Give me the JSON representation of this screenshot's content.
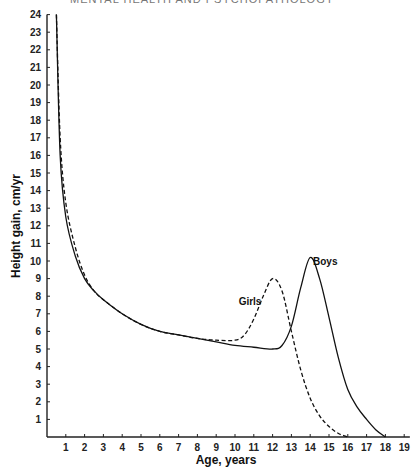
{
  "header": {
    "text": "MENTAL HEALTH AND PSYCHOPATHOLOGY"
  },
  "chart_data": {
    "type": "line",
    "title": "",
    "xlabel": "Age, years",
    "ylabel": "Height gain, cm/yr",
    "xlim": [
      0,
      19
    ],
    "ylim": [
      0,
      24
    ],
    "x_ticks": [
      1,
      2,
      3,
      4,
      5,
      6,
      7,
      8,
      9,
      10,
      11,
      12,
      13,
      14,
      15,
      16,
      17,
      18,
      19
    ],
    "y_ticks": [
      1,
      2,
      3,
      4,
      5,
      6,
      7,
      8,
      9,
      10,
      11,
      12,
      13,
      14,
      15,
      16,
      17,
      18,
      19,
      20,
      21,
      22,
      23,
      24
    ],
    "grid": false,
    "legend": "inline annotations",
    "series": [
      {
        "name": "Boys",
        "style": "solid",
        "x": [
          0.5,
          0.7,
          1.0,
          1.5,
          2.0,
          2.5,
          3.0,
          4.0,
          5.0,
          6.0,
          7.0,
          8.0,
          9.0,
          10.0,
          11.0,
          12.0,
          12.5,
          13.0,
          13.5,
          14.0,
          14.5,
          15.0,
          15.5,
          16.0,
          16.5,
          17.0,
          17.5,
          18.0
        ],
        "values": [
          24,
          16.0,
          12.5,
          10.3,
          9.0,
          8.3,
          7.8,
          7.0,
          6.4,
          6.0,
          5.8,
          5.6,
          5.4,
          5.2,
          5.1,
          5.0,
          5.2,
          6.3,
          8.5,
          10.2,
          9.0,
          6.8,
          4.5,
          2.7,
          1.7,
          1.0,
          0.4,
          0.0
        ]
      },
      {
        "name": "Girls",
        "style": "dashed",
        "x": [
          0.5,
          0.7,
          1.0,
          1.5,
          2.0,
          2.5,
          3.0,
          4.0,
          5.0,
          6.0,
          7.0,
          8.0,
          9.0,
          10.0,
          10.5,
          11.0,
          11.5,
          12.0,
          12.5,
          13.0,
          13.5,
          14.0,
          14.5,
          15.0,
          15.5,
          16.0
        ],
        "values": [
          24,
          17.0,
          13.3,
          10.8,
          9.2,
          8.3,
          7.8,
          7.0,
          6.4,
          6.0,
          5.8,
          5.6,
          5.5,
          5.5,
          5.8,
          6.7,
          8.0,
          9.0,
          8.3,
          6.0,
          3.8,
          2.2,
          1.2,
          0.6,
          0.2,
          0.0
        ]
      }
    ],
    "annotations": [
      {
        "text": "Girls",
        "x": 10.8,
        "y": 7.5
      },
      {
        "text": "Boys",
        "x": 14.8,
        "y": 9.8
      }
    ]
  }
}
